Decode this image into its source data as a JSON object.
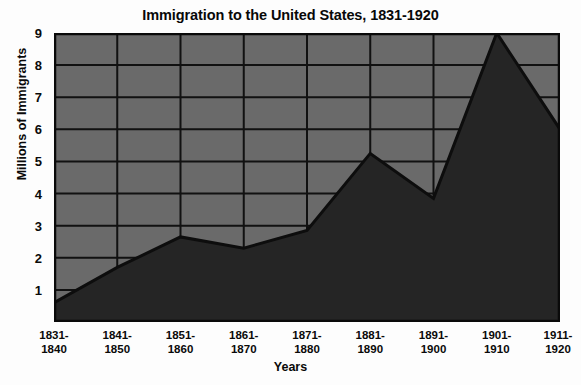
{
  "chart_data": {
    "type": "area",
    "title": "Immigration to the United States, 1831-1920",
    "xlabel": "Years",
    "ylabel": "Millions of Immigrants",
    "categories": [
      "1831-1840",
      "1841-1850",
      "1851-1860",
      "1861-1870",
      "1871-1880",
      "1881-1890",
      "1891-1900",
      "1901-1910",
      "1911-1920"
    ],
    "values": [
      0.6,
      1.7,
      2.65,
      2.3,
      2.85,
      5.25,
      3.85,
      9.0,
      6.0
    ],
    "ylim": [
      0,
      9
    ],
    "yticks": [
      1,
      2,
      3,
      4,
      5,
      6,
      7,
      8,
      9
    ],
    "ytick_labels": [
      "1",
      "2",
      "3",
      "4",
      "5",
      "6",
      "7",
      "8",
      "9"
    ],
    "xtick_labels_line1": [
      "1831-",
      "1841-",
      "1851-",
      "1861-",
      "1871-",
      "1881-",
      "1891-",
      "1901-",
      "1911-"
    ],
    "xtick_labels_line2": [
      "1840",
      "1850",
      "1860",
      "1870",
      "1880",
      "1890",
      "1900",
      "1910",
      "1920"
    ],
    "grid": true,
    "legend": "none",
    "colors": {
      "plot_background": "#6a6a6a",
      "area_fill": "#252525",
      "line": "#0d0d0d",
      "grid": "#111111",
      "axis": "#0a0a0a",
      "page_background": "#fdfdfd",
      "text": "#0a0a0a"
    }
  }
}
